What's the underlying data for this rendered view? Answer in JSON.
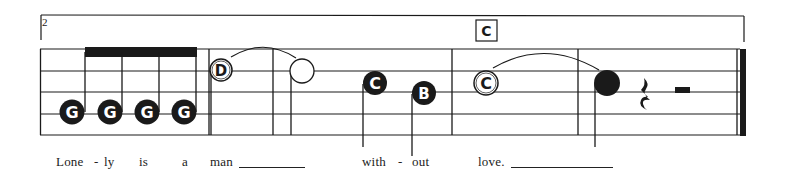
{
  "score": {
    "measure_number": "2",
    "rehearsal_mark": "C",
    "colors": {
      "ink": "#1a1a1a",
      "paper": "#ffffff"
    },
    "staff": {
      "lines": 5,
      "x_start": 40,
      "x_end": 746,
      "line_y": [
        49,
        71,
        92,
        114,
        135
      ]
    },
    "barlines_x": [
      209,
      273,
      452,
      578
    ],
    "final_barline": {
      "thin_x": 737,
      "thick_x": 743
    },
    "notes": [
      {
        "letter": "G",
        "style": "filled",
        "duration": "eighth",
        "x": 72,
        "y": 112
      },
      {
        "letter": "G",
        "style": "filled",
        "duration": "eighth",
        "x": 110,
        "y": 112
      },
      {
        "letter": "G",
        "style": "filled",
        "duration": "eighth",
        "x": 147,
        "y": 112
      },
      {
        "letter": "G",
        "style": "filled",
        "duration": "eighth",
        "x": 184,
        "y": 112
      },
      {
        "letter": "D",
        "style": "open-labeled",
        "duration": "half",
        "x": 221,
        "y": 70
      },
      {
        "letter": "",
        "style": "open",
        "duration": "half",
        "x": 302,
        "y": 71
      },
      {
        "letter": "C",
        "style": "filled",
        "duration": "quarter",
        "x": 375,
        "y": 83
      },
      {
        "letter": "B",
        "style": "filled",
        "duration": "quarter",
        "x": 424,
        "y": 93
      },
      {
        "letter": "C",
        "style": "open-labeled",
        "duration": "whole",
        "x": 486,
        "y": 83
      },
      {
        "letter": "",
        "style": "filled",
        "duration": "quarter",
        "x": 607,
        "y": 83
      }
    ],
    "rests": [
      {
        "type": "quarter-rest",
        "x": 645
      },
      {
        "type": "half-rest",
        "x": 682
      }
    ],
    "lyrics": [
      {
        "text": "Lone",
        "x": 56
      },
      {
        "text": "-",
        "x": 94
      },
      {
        "text": "ly",
        "x": 104
      },
      {
        "text": "is",
        "x": 139
      },
      {
        "text": "a",
        "x": 182
      },
      {
        "text": "man",
        "x": 210
      },
      {
        "text": "with",
        "x": 362
      },
      {
        "text": "-",
        "x": 398
      },
      {
        "text": "out",
        "x": 412
      },
      {
        "text": "love.",
        "x": 478
      }
    ],
    "extenders": [
      {
        "x1": 239,
        "x2": 305
      },
      {
        "x1": 511,
        "x2": 613
      }
    ]
  }
}
